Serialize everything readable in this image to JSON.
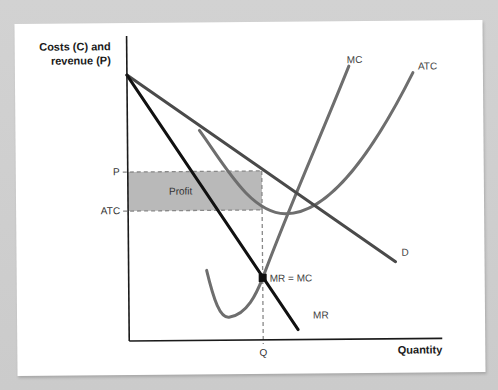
{
  "chart_data": {
    "type": "diagram",
    "title": "",
    "ylabel_lines": [
      "Costs (C) and",
      "revenue (P)"
    ],
    "xlabel": "Quantity",
    "grid": false,
    "colors": {
      "axis": "#1a1a1a",
      "demand": "#4a4a4a",
      "mr": "#111111",
      "mc": "#6e6e6e",
      "atc": "#6e6e6e",
      "profit_fill": "#b9b9b9",
      "dashed": "#888888",
      "point": "#111111"
    },
    "axes": {
      "origin": [
        128,
        340
      ],
      "x_end": [
        441,
        340
      ],
      "y_top": [
        128,
        35
      ]
    },
    "curves": {
      "D": {
        "label": "D",
        "label_pos": [
          401,
          257
        ],
        "path": "M128,74 L395,263"
      },
      "MR": {
        "label": "MR",
        "label_pos": [
          312,
          319
        ],
        "path": "M128,74 L297,330"
      },
      "MC": {
        "label": "MC",
        "label_pos": [
          348,
          64
        ],
        "path": "M206,270 C213,300 219,318 228,317 C246,315 256,293 262,278 C290,205 320,140 350,67"
      },
      "ATC": {
        "label": "ATC",
        "label_pos": [
          419,
          71
        ],
        "path": "M200,130 C225,165 250,213 285,214 C330,215 375,150 414,74"
      }
    },
    "profit_area": {
      "label": "Profit",
      "x0": 128,
      "x1": 262,
      "y_top": 171,
      "y_bottom": 210,
      "label_pos": [
        169,
        194
      ]
    },
    "ticks": {
      "y": [
        {
          "label": "P",
          "y": 171,
          "label_pos": [
            120,
            174
          ]
        },
        {
          "label": "ATC",
          "y": 210,
          "label_pos": [
            120,
            213
          ]
        }
      ],
      "x": [
        {
          "label": "Q",
          "x": 262,
          "label_pos": [
            262,
            356
          ]
        }
      ]
    },
    "equilibrium": {
      "label": "MR = MC",
      "point": [
        262,
        278
      ],
      "label_pos": [
        269,
        282
      ]
    },
    "annotations": [
      "Profit",
      "MR = MC"
    ]
  }
}
